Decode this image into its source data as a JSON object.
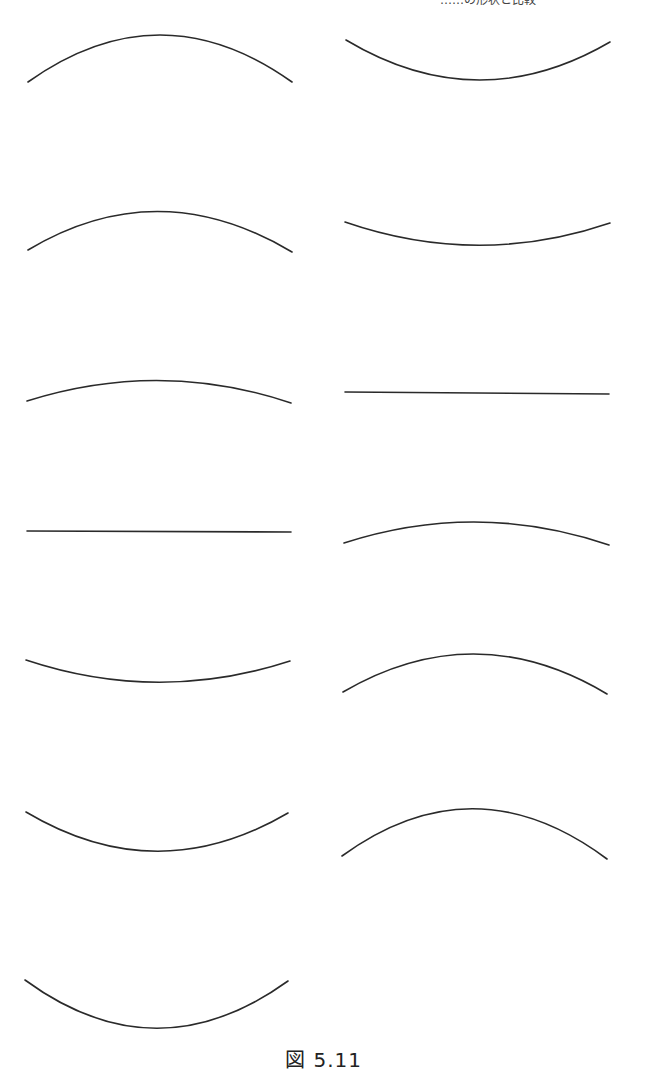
{
  "header": {
    "fragment_text": "……の形状と比較"
  },
  "figure": {
    "caption": "図 5.11",
    "stroke_color": "#2a2a2a",
    "background": "#ffffff",
    "layout": "two columns of curve segments, 7 on the left, 6 on the right",
    "curves": [
      {
        "id": "L1",
        "column": "left",
        "type": "arc-up",
        "start": [
          28,
          82
        ],
        "control": [
          160,
          -12
        ],
        "end": [
          292,
          82
        ]
      },
      {
        "id": "L2",
        "column": "left",
        "type": "arc-up",
        "start": [
          28,
          250
        ],
        "control": [
          158,
          172
        ],
        "end": [
          292,
          252
        ]
      },
      {
        "id": "L3",
        "column": "left",
        "type": "arc-up",
        "start": [
          27,
          401
        ],
        "control": [
          160,
          359
        ],
        "end": [
          291,
          403
        ]
      },
      {
        "id": "L4",
        "column": "left",
        "type": "line",
        "start": [
          27,
          531
        ],
        "control": [
          159,
          531
        ],
        "end": [
          291,
          532
        ]
      },
      {
        "id": "L5",
        "column": "left",
        "type": "arc-down",
        "start": [
          26,
          660
        ],
        "control": [
          158,
          704
        ],
        "end": [
          290,
          661
        ]
      },
      {
        "id": "L6",
        "column": "left",
        "type": "arc-down",
        "start": [
          26,
          812
        ],
        "control": [
          157,
          890
        ],
        "end": [
          288,
          813
        ]
      },
      {
        "id": "L7",
        "column": "left",
        "type": "arc-down",
        "start": [
          25,
          980
        ],
        "control": [
          156,
          1076
        ],
        "end": [
          288,
          981
        ]
      },
      {
        "id": "R1",
        "column": "right",
        "type": "arc-down",
        "start": [
          346,
          40
        ],
        "control": [
          478,
          119
        ],
        "end": [
          610,
          42
        ]
      },
      {
        "id": "R2",
        "column": "right",
        "type": "arc-down",
        "start": [
          345,
          222
        ],
        "control": [
          478,
          268
        ],
        "end": [
          610,
          223
        ]
      },
      {
        "id": "R3",
        "column": "right",
        "type": "line",
        "start": [
          345,
          392
        ],
        "control": [
          477,
          393
        ],
        "end": [
          609,
          394
        ]
      },
      {
        "id": "R4",
        "column": "right",
        "type": "arc-up",
        "start": [
          344,
          543
        ],
        "control": [
          477,
          500
        ],
        "end": [
          609,
          545
        ]
      },
      {
        "id": "R5",
        "column": "right",
        "type": "arc-up",
        "start": [
          343,
          692
        ],
        "control": [
          475,
          615
        ],
        "end": [
          607,
          694
        ]
      },
      {
        "id": "R6",
        "column": "right",
        "type": "arc-up",
        "start": [
          342,
          856
        ],
        "control": [
          474,
          760
        ],
        "end": [
          607,
          859
        ]
      }
    ]
  }
}
